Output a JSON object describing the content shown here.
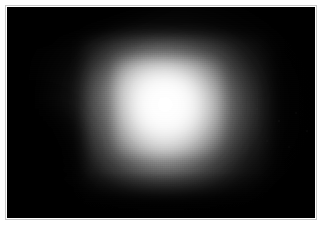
{
  "image": {
    "kind": "grayscale-glow-photograph",
    "width": 328,
    "height": 230,
    "frame": {
      "style": "white-mount",
      "border_width_px": 7,
      "mount_color": "#ffffff",
      "inset_line_color": "#c9c9c9"
    },
    "field": {
      "x": 7,
      "y": 7,
      "width": 308,
      "height": 211,
      "background_color": "#000000"
    },
    "subject": {
      "description": "diffuse luminous blob",
      "core_color": "#ffffff",
      "mantle_color": "#b4b4b4",
      "halo_color": "#3c3c3c",
      "background_color": "#000000",
      "core_center_x": 157,
      "core_center_y": 100,
      "core_radius_px": 26,
      "mantle_radius_px": 62,
      "halo_extent_px": 120
    },
    "features": [
      {
        "name": "upper-left-arm",
        "description": "dim luminous extension toward upper left",
        "center_x": 95,
        "center_y": 80
      },
      {
        "name": "left-concave-notch",
        "description": "dark concave indentation on the left flank",
        "center_x": 72,
        "center_y": 140
      },
      {
        "name": "right-shoulder-lobe",
        "description": "broad gradual falloff to the right",
        "center_x": 225,
        "center_y": 105
      },
      {
        "name": "lower-tail",
        "description": "dim tail fading toward the bottom edge",
        "center_x": 165,
        "center_y": 180
      },
      {
        "name": "top-dark-cutoff",
        "description": "sharp dark boundary across the top",
        "center_x": 160,
        "center_y": 30
      }
    ]
  }
}
